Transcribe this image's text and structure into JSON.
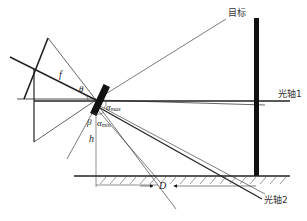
{
  "diagram": {
    "labels": {
      "target": "目标",
      "optical_axis_1": "光轴1",
      "optical_axis_2": "光轴2",
      "focal_length": "f",
      "theta": "θ",
      "alpha_max": "α",
      "alpha_max_sub": "max",
      "alpha_min": "α",
      "alpha_min_sub": "min",
      "beta": "β",
      "height": "h",
      "distance": "D"
    },
    "colors": {
      "line": "#222222",
      "thin_line": "#555555",
      "mirror": "#111111",
      "target_bar": "#111111",
      "hatch": "#555555"
    }
  }
}
